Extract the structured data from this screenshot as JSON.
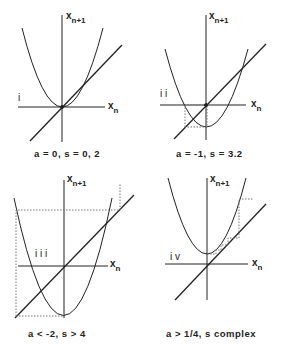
{
  "panels": [
    {
      "id": "i",
      "roman": "i",
      "caption": "a = 0, s = 0, 2",
      "x_axis": "x",
      "x_sub": "n",
      "y_axis": "x",
      "y_sub": "n+1"
    },
    {
      "id": "ii",
      "roman": "i i",
      "caption": "a = -1, s = 3.2",
      "x_axis": "x",
      "x_sub": "n",
      "y_axis": "x",
      "y_sub": "n+1"
    },
    {
      "id": "iii",
      "roman": "i i i",
      "caption": "a < -2, s > 4",
      "x_axis": "x",
      "x_sub": "n",
      "y_axis": "x",
      "y_sub": "n+1"
    },
    {
      "id": "iv",
      "roman": "i v",
      "caption": "a > 1/4, s complex",
      "x_axis": "x",
      "x_sub": "n",
      "y_axis": "x",
      "y_sub": "n+1"
    }
  ],
  "colors": {
    "ink": "#222222",
    "dotted": "#666666"
  }
}
